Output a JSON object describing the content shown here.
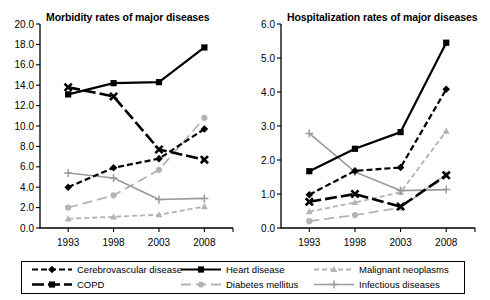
{
  "legend": {
    "entries": [
      {
        "label": "Cerebrovascular disease",
        "color": "#000000",
        "dash": "6,3",
        "marker": "diamond",
        "width": 2.2
      },
      {
        "label": "Heart disease",
        "color": "#000000",
        "dash": "none",
        "marker": "square",
        "width": 2.2
      },
      {
        "label": "Malignant neoplasms",
        "color": "#b3b3b3",
        "dash": "5,3",
        "marker": "triangle",
        "width": 1.8
      },
      {
        "label": "COPD",
        "color": "#000000",
        "dash": "12,4",
        "marker": "square",
        "width": 2.6
      },
      {
        "label": "Diabetes mellitus",
        "color": "#b3b3b3",
        "dash": "10,5",
        "marker": "circle",
        "width": 1.8
      },
      {
        "label": "Infectious diseases",
        "color": "#9a9a9a",
        "dash": "none",
        "marker": "plus",
        "width": 1.6
      }
    ]
  },
  "chart_data": [
    {
      "type": "line",
      "title": "Morbidity rates of major diseases",
      "xlabel": "",
      "ylabel": "",
      "categories": [
        "1993",
        "1998",
        "2003",
        "2008"
      ],
      "x": [
        1993,
        1998,
        2003,
        2008
      ],
      "ylim": [
        0.0,
        20.0
      ],
      "ytick_step": 2.0,
      "yticks": [
        "0.0",
        "2.0",
        "4.0",
        "6.0",
        "8.0",
        "10.0",
        "12.0",
        "14.0",
        "16.0",
        "18.0",
        "20.0"
      ],
      "grid": false,
      "legend_position": "bottom",
      "series": [
        {
          "name": "Cerebrovascular disease",
          "values": [
            4.0,
            5.9,
            6.8,
            9.7
          ]
        },
        {
          "name": "Heart disease",
          "values": [
            13.1,
            14.2,
            14.3,
            17.7
          ]
        },
        {
          "name": "Malignant neoplasms",
          "values": [
            0.9,
            1.1,
            1.3,
            2.1
          ]
        },
        {
          "name": "COPD",
          "values": [
            13.8,
            12.9,
            7.7,
            6.7
          ]
        },
        {
          "name": "Diabetes mellitus",
          "values": [
            2.0,
            3.2,
            5.7,
            10.8
          ]
        },
        {
          "name": "Infectious diseases",
          "values": [
            5.4,
            4.9,
            2.8,
            2.9
          ]
        }
      ]
    },
    {
      "type": "line",
      "title": "Hospitalization rates of major diseases",
      "xlabel": "",
      "ylabel": "",
      "categories": [
        "1993",
        "1998",
        "2003",
        "2008"
      ],
      "x": [
        1993,
        1998,
        2003,
        2008
      ],
      "ylim": [
        0.0,
        6.0
      ],
      "ytick_step": 1.0,
      "yticks": [
        "0.0",
        "1.0",
        "2.0",
        "3.0",
        "4.0",
        "5.0",
        "6.0"
      ],
      "grid": false,
      "legend_position": "bottom",
      "series": [
        {
          "name": "Cerebrovascular disease",
          "values": [
            0.98,
            1.68,
            1.78,
            4.08
          ]
        },
        {
          "name": "Heart disease",
          "values": [
            1.67,
            2.33,
            2.82,
            5.45
          ]
        },
        {
          "name": "Malignant neoplasms",
          "values": [
            0.48,
            0.75,
            1.05,
            2.85
          ]
        },
        {
          "name": "COPD",
          "values": [
            0.77,
            1.0,
            0.63,
            1.55
          ]
        },
        {
          "name": "Diabetes mellitus",
          "values": [
            0.2,
            0.38,
            0.6,
            1.57
          ]
        },
        {
          "name": "Infectious diseases",
          "values": [
            2.78,
            1.65,
            1.1,
            1.13
          ]
        }
      ]
    }
  ]
}
